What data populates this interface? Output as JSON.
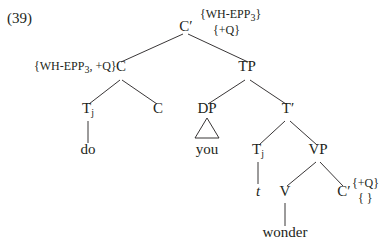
{
  "example_number": "(39)",
  "tree": {
    "root": {
      "label": "C′",
      "features_line1": "{WH-EPP3}",
      "features_line2": "{+Q}"
    },
    "c_head": {
      "label": "C",
      "features": "{WH-EPP3,+Q}"
    },
    "tj_upper": {
      "label": "T",
      "subscript": "j",
      "terminal": "do"
    },
    "c_lower": {
      "label": "C"
    },
    "tp": {
      "label": "TP"
    },
    "dp": {
      "label": "DP",
      "terminal": "you",
      "triangle": true
    },
    "t_bar": {
      "label": "T′"
    },
    "tj_lower": {
      "label": "T",
      "subscript": "j",
      "terminal": "t"
    },
    "vp": {
      "label": "VP"
    },
    "v": {
      "label": "V",
      "terminal": "wonder"
    },
    "c_prime_lower": {
      "label": "C′",
      "features_line1": "{+Q}",
      "features_line2": "{ }"
    }
  },
  "text": {
    "wh_epp_top": "WH-EPP",
    "wh_epp_sub": "3",
    "plus_q": "+Q",
    "wh_epp_left": "WH-EPP",
    "wh_epp_left_sub": "3"
  },
  "colors": {
    "ink": "#231f20",
    "background": "#ffffff"
  }
}
